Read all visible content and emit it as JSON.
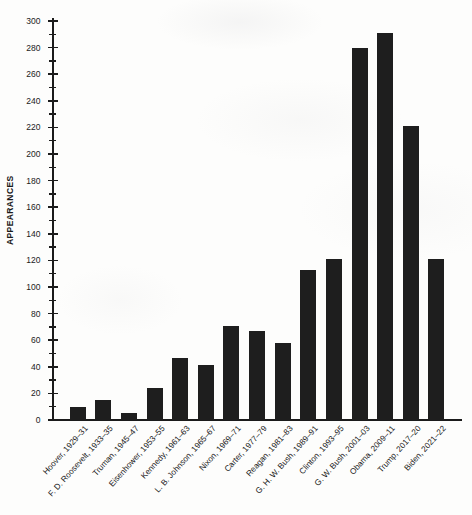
{
  "chart_data": {
    "type": "bar",
    "title": "",
    "xlabel": "",
    "ylabel": "APPEARANCES",
    "ylim": [
      0,
      300
    ],
    "ytick_step": 20,
    "yminor_step": 10,
    "grid": false,
    "legend": false,
    "bar_color": "#1e1e1e",
    "background_color": "#fdfdfc",
    "axis_color": "#1b1b1b",
    "yticks": [
      0,
      20,
      40,
      60,
      80,
      100,
      120,
      140,
      160,
      180,
      200,
      220,
      240,
      260,
      280,
      300
    ],
    "categories": [
      "Hoover, 1929–31",
      "F. D. Roosevelt, 1933–35",
      "Truman, 1945–47",
      "Eisenhower, 1953–55",
      "Kennedy, 1961–63",
      "L. B. Johnson, 1965–67",
      "Nixon, 1969–71",
      "Carter, 1977–79",
      "Reagan, 1981–83",
      "G. H. W. Bush, 1989–91",
      "Clinton, 1993–95",
      "G. W. Bush, 2001–03",
      "Obama, 2009–11",
      "Trump, 2017–20",
      "Biden, 2021–22"
    ],
    "values": [
      10,
      15,
      5,
      24,
      47,
      41,
      71,
      67,
      58,
      113,
      121,
      280,
      291,
      221,
      121
    ]
  }
}
